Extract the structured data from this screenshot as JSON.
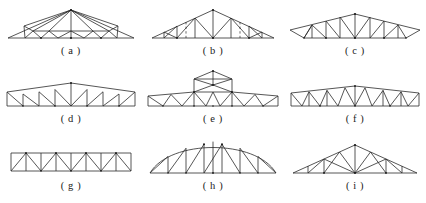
{
  "figure": {
    "background_color": "#ffffff",
    "line_color": "#2b2b2b",
    "joint_color": "#1a1a1a",
    "columns": 3,
    "rows": 3
  },
  "trusses": [
    {
      "id": "a",
      "caption": "( a )",
      "name": "low-pitch-gable-fan-truss",
      "description": "Shallow symmetric gable truss with single central vertical king post and fan-and-W web bracing in each half",
      "top_chord": "straight sloping, apex at center",
      "bottom_chord": "straight horizontal",
      "span": 126,
      "rise": 20,
      "web_pattern": "fan + W"
    },
    {
      "id": "b",
      "caption": "( b )",
      "name": "gable-truss-with-dashed-verticals",
      "description": "Symmetric gable truss with Fink style diagonals, solid verticals at panel points and dashed optional verticals at quarter points",
      "top_chord": "straight sloping, apex at center",
      "bottom_chord": "straight horizontal",
      "span": 122,
      "rise": 22,
      "web_pattern": "Fink with dashed secondary verticals"
    },
    {
      "id": "c",
      "caption": "( c )",
      "name": "cambered-truss-with-overhangs",
      "description": "Low slope truss with slightly cambered bottom chord and pointed overhanging eaves at both ends, Warren style diagonals with verticals",
      "top_chord": "shallow peak at center with cantilever tails",
      "bottom_chord": "slightly cambered, shorter than top chord",
      "span": 128,
      "rise": 16,
      "web_pattern": "Warren with verticals"
    },
    {
      "id": "d",
      "caption": "( d )",
      "name": "cambered-parallel-chord-truss",
      "description": "Nearly parallel chord truss with slight camber in the top chord, vertical posts at every panel point and single diagonals forming Pratt pattern",
      "top_chord": "slightly cambered, apex at center",
      "bottom_chord": "straight horizontal",
      "span": 130,
      "rise": 9,
      "web_pattern": "Pratt with verticals"
    },
    {
      "id": "e",
      "caption": "( e )",
      "name": "monitor-roof-truss",
      "description": "Low slope truss carrying a raised central monitor or clerestory box with its own gable cap and cross bracing inside",
      "top_chord": "shallow slope with raised central monitor",
      "bottom_chord": "straight horizontal",
      "span": 132,
      "rise": 12,
      "monitor_height": 18,
      "web_pattern": "Warren with verticals plus braced monitor"
    },
    {
      "id": "f",
      "caption": "( f )",
      "name": "cambered-truss-dense-web",
      "description": "Shallow cambered parallel chord truss with closely spaced double diagonal W web members and end verticals",
      "top_chord": "slightly cambered",
      "bottom_chord": "straight horizontal",
      "span": 130,
      "rise": 8,
      "web_pattern": "dense W / double Warren"
    },
    {
      "id": "g",
      "caption": "( g )",
      "name": "flat-parallel-chord-truss",
      "description": "Flat parallel chord truss of constant depth with vertical posts and alternating diagonals forming Warren with verticals",
      "top_chord": "straight horizontal",
      "bottom_chord": "straight horizontal",
      "span": 120,
      "rise": 0,
      "web_pattern": "Warren with verticals"
    },
    {
      "id": "h",
      "caption": "( h )",
      "name": "bowstring-arched-truss",
      "description": "Bowstring truss with smoothly curved arched top chord, straight horizontal bottom chord, radial verticals and diagonals",
      "top_chord": "curved arch",
      "bottom_chord": "straight horizontal",
      "span": 128,
      "rise": 26,
      "web_pattern": "verticals with diagonals"
    },
    {
      "id": "i",
      "caption": "( i )",
      "name": "fink-gable-truss",
      "description": "Symmetric pitched gable truss with Fink web arrangement, central vertical king post and intermediate verticals",
      "top_chord": "straight sloping, apex at center",
      "bottom_chord": "straight horizontal",
      "span": 124,
      "rise": 26,
      "web_pattern": "Fink"
    }
  ]
}
